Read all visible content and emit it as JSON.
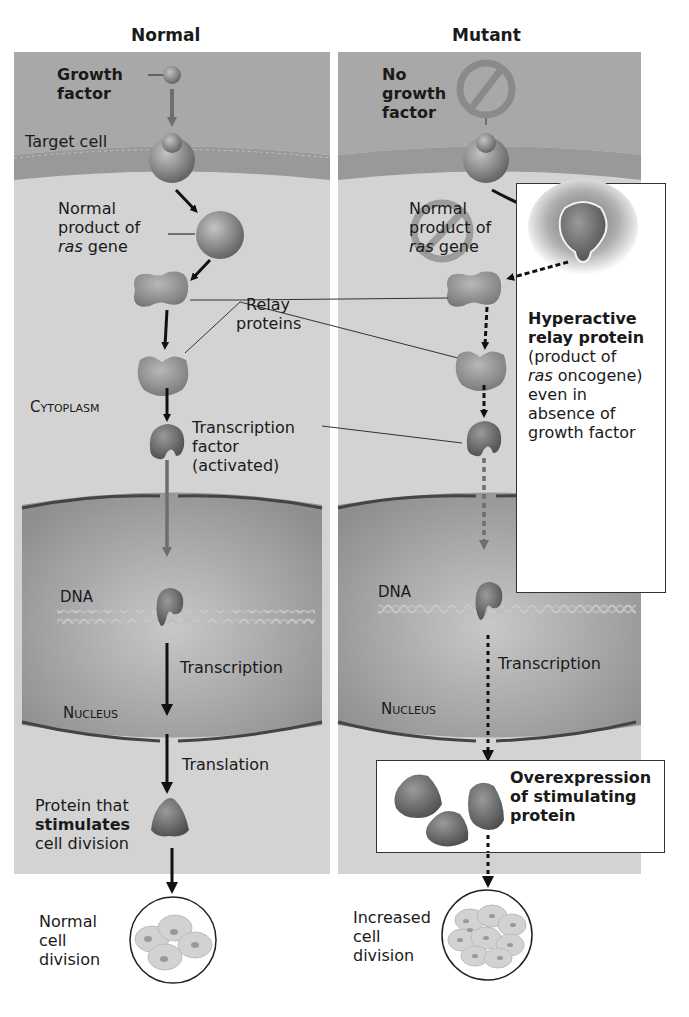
{
  "titles": {
    "normal": "Normal",
    "mutant": "Mutant"
  },
  "normal": {
    "growth_factor": [
      "Growth",
      "factor"
    ],
    "target_cell": "Target cell",
    "ras_product": [
      "Normal",
      "product of",
      "ras",
      "gene"
    ],
    "relay": [
      "Relay",
      "proteins"
    ],
    "cytoplasm": "Cytoplasm",
    "tf": [
      "Transcription",
      "factor",
      "(activated)"
    ],
    "dna": "DNA",
    "transcription": "Transcription",
    "nucleus": "Nucleus",
    "translation": "Translation",
    "protein": [
      "Protein that",
      "stimulates",
      "cell division"
    ],
    "outcome": [
      "Normal",
      "cell",
      "division"
    ]
  },
  "mutant": {
    "no_gf": [
      "No",
      "growth",
      "factor"
    ],
    "ras_product": [
      "Normal",
      "product of",
      "ras",
      "gene"
    ],
    "hyper": {
      "bold": [
        "Hyperactive",
        "relay protein"
      ],
      "text": [
        "(product of",
        "ras",
        "oncogene)",
        "even in",
        "absence of",
        "growth factor"
      ]
    },
    "dna": "DNA",
    "transcription": "Transcription",
    "nucleus": "Nucleus",
    "overexpression": [
      "Overexpression",
      "of stimulating",
      "protein"
    ],
    "outcome": [
      "Increased",
      "cell",
      "division"
    ]
  },
  "colors": {
    "extracellular": "#a9a9a9",
    "membrane": "#9a9a9a",
    "cytoplasm": "#d2d2d2",
    "nucleus": "#9c9c9c",
    "protein": "#7d7d7d",
    "arrow": "#111111",
    "gray_arrow": "#6e6e6e"
  }
}
